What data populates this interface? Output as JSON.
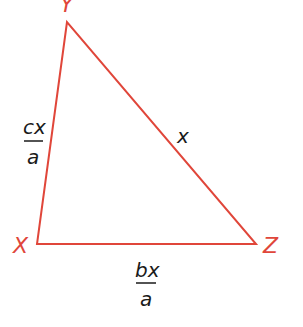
{
  "diagram": {
    "type": "triangle",
    "color": "#e0463a",
    "text_color": "#1a1a1a",
    "vertices": [
      {
        "name": "Y",
        "label": "Y",
        "x": 67,
        "y": 22
      },
      {
        "name": "X",
        "label": "X",
        "x": 37,
        "y": 244
      },
      {
        "name": "Z",
        "label": "Z",
        "x": 256,
        "y": 244
      }
    ],
    "sides": {
      "XY": {
        "numerator": "cx",
        "denominator": "a"
      },
      "YZ": {
        "label": "x"
      },
      "XZ": {
        "numerator": "bx",
        "denominator": "a"
      }
    }
  }
}
